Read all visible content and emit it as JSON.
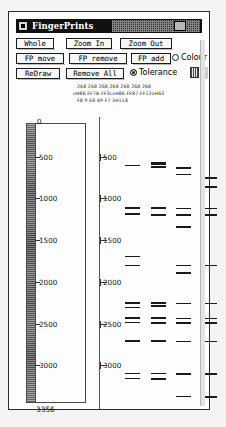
{
  "window": {
    "title": "FingerPrints",
    "menu_icon": "window-menu-icon"
  },
  "toolbar": {
    "row1": [
      {
        "name": "whole",
        "label": "Whole"
      },
      {
        "name": "zoom-in",
        "label": "Zoom In"
      },
      {
        "name": "zoom-out",
        "label": "Zoom Out"
      }
    ],
    "row2": [
      {
        "name": "fp-move",
        "label": "FP move"
      },
      {
        "name": "fp-remove",
        "label": "FP remove"
      },
      {
        "name": "fp-add",
        "label": "FP add"
      }
    ],
    "row3": [
      {
        "name": "redraw",
        "label": "ReDraw"
      },
      {
        "name": "remove-all",
        "label": "Remove All"
      }
    ],
    "colour_radio": {
      "label": "Colour",
      "selected": false
    },
    "tolerance_radio": {
      "label": "Tolerance",
      "selected": true
    }
  },
  "readout": {
    "line1": "268  268  268  268  268  268  268",
    "line2": "oH86 FF7B FF3LoH86 FF87 FF12oH63",
    "line3": "F8   9    E8   69   F7   3H118"
  },
  "chart_data": {
    "type": "bar",
    "title": "",
    "xlabel": "",
    "ylabel": "",
    "orientation": "horizontal-bands",
    "axis_min": 0,
    "axis_max": 3356,
    "ylim": [
      0,
      3356
    ],
    "grid": false,
    "tick_values": [
      500,
      1000,
      1500,
      2000,
      2500,
      3000
    ],
    "tick_labels": [
      "500",
      "1000",
      "1500",
      "2000",
      "2500",
      "3000"
    ],
    "zero_label": "0",
    "end_label": "3356",
    "scales": [
      "inner-ruler",
      "outer-ruler"
    ],
    "lane_count": 7,
    "lanes": [
      {
        "name": "lane-1",
        "x": 0,
        "values": [
          500,
          1010,
          1080,
          1590,
          1700,
          2150,
          2200,
          2330,
          2380,
          2600,
          2995,
          3055
        ]
      },
      {
        "name": "lane-2",
        "x": 1,
        "values": [
          470,
          480,
          520,
          1010,
          1090,
          2150,
          2185,
          2330,
          2385,
          2600,
          2995,
          3060,
          3065
        ]
      },
      {
        "name": "lane-3",
        "x": 2,
        "values": [
          530,
          610,
          1015,
          1085,
          1095,
          1240,
          1700,
          1790,
          2155,
          2335,
          2390,
          2610,
          3000,
          3270
        ]
      },
      {
        "name": "lane-4",
        "x": 3,
        "values": [
          650,
          760,
          1015,
          1090,
          1700,
          2155,
          2335,
          2390,
          2610,
          3000,
          3275
        ]
      },
      {
        "name": "lane-5",
        "x": 4,
        "values": [
          1015,
          1090,
          1700,
          2155,
          2335,
          2390,
          2615,
          3005,
          3280
        ]
      },
      {
        "name": "lane-6",
        "x": 5,
        "values": [
          520,
          640,
          755,
          1020,
          1090,
          1700,
          2155,
          2340,
          2395,
          2615,
          3005,
          3285
        ]
      },
      {
        "name": "lane-7",
        "x": 6,
        "values": [
          505,
          1020,
          1700,
          2145,
          2160,
          2340,
          2395,
          2620,
          2760,
          3010,
          3290
        ]
      }
    ]
  }
}
